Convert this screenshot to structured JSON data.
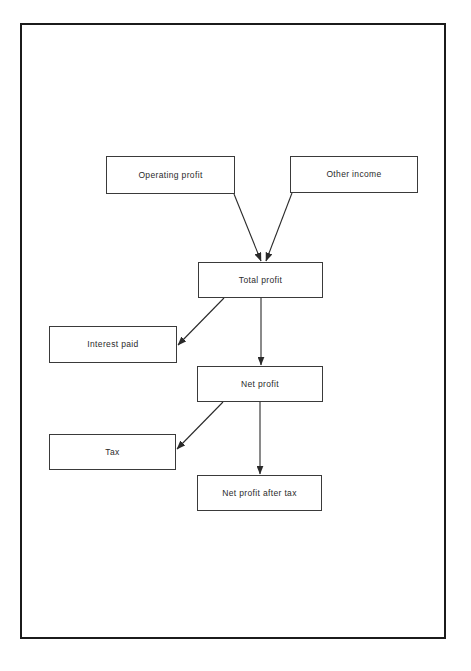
{
  "diagram": {
    "frame": {
      "x": 20,
      "y": 23,
      "width": 426,
      "height": 616,
      "border_color": "#1b1b1b",
      "border_width": 2,
      "background": "#ffffff"
    },
    "style": {
      "node_border_color": "#3a3a3a",
      "node_background": "#ffffff",
      "text_color": "#2a2a2a",
      "connector_color": "#2a2a2a"
    },
    "nodes": [
      {
        "id": "operating-profit",
        "label": "Operating profit",
        "x": 106,
        "y": 156,
        "width": 129,
        "height": 38
      },
      {
        "id": "other-income",
        "label": "Other income",
        "x": 290,
        "y": 156,
        "width": 128,
        "height": 37
      },
      {
        "id": "total-profit",
        "label": "Total profit",
        "x": 198,
        "y": 262,
        "width": 125,
        "height": 36
      },
      {
        "id": "interest-paid",
        "label": "Interest paid",
        "x": 49,
        "y": 326,
        "width": 128,
        "height": 37
      },
      {
        "id": "net-profit",
        "label": "Net profit",
        "x": 197,
        "y": 366,
        "width": 126,
        "height": 36
      },
      {
        "id": "tax",
        "label": "Tax",
        "x": 49,
        "y": 434,
        "width": 127,
        "height": 36
      },
      {
        "id": "net-profit-after-tax",
        "label": "Net profit after tax",
        "x": 197,
        "y": 475,
        "width": 125,
        "height": 36
      }
    ],
    "edges": [
      {
        "id": "operating-profit-to-total-profit",
        "from": "operating-profit",
        "to": "total-profit",
        "x1": 234,
        "y1": 194,
        "x2": 261,
        "y2": 261
      },
      {
        "id": "other-income-to-total-profit",
        "from": "other-income",
        "to": "total-profit",
        "x1": 292,
        "y1": 193,
        "x2": 266,
        "y2": 261
      },
      {
        "id": "total-profit-to-interest-paid",
        "from": "total-profit",
        "to": "interest-paid",
        "x1": 224,
        "y1": 298,
        "x2": 178,
        "y2": 345
      },
      {
        "id": "total-profit-to-net-profit",
        "from": "total-profit",
        "to": "net-profit",
        "x1": 261,
        "y1": 298,
        "x2": 261,
        "y2": 365
      },
      {
        "id": "net-profit-to-tax",
        "from": "net-profit",
        "to": "tax",
        "x1": 223,
        "y1": 402,
        "x2": 177,
        "y2": 449
      },
      {
        "id": "net-profit-to-net-profit-after-tax",
        "from": "net-profit",
        "to": "net-profit-after-tax",
        "x1": 260,
        "y1": 402,
        "x2": 260,
        "y2": 474
      }
    ]
  }
}
